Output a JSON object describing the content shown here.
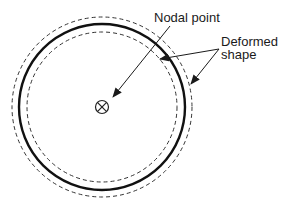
{
  "diagram": {
    "labels": {
      "nodal_point": "Nodal point",
      "deformed_line1": "Deformed",
      "deformed_line2": "shape"
    },
    "center_symbol": "circled-cross",
    "colors": {
      "line": "#1a1a1a",
      "background": "#ffffff"
    }
  }
}
